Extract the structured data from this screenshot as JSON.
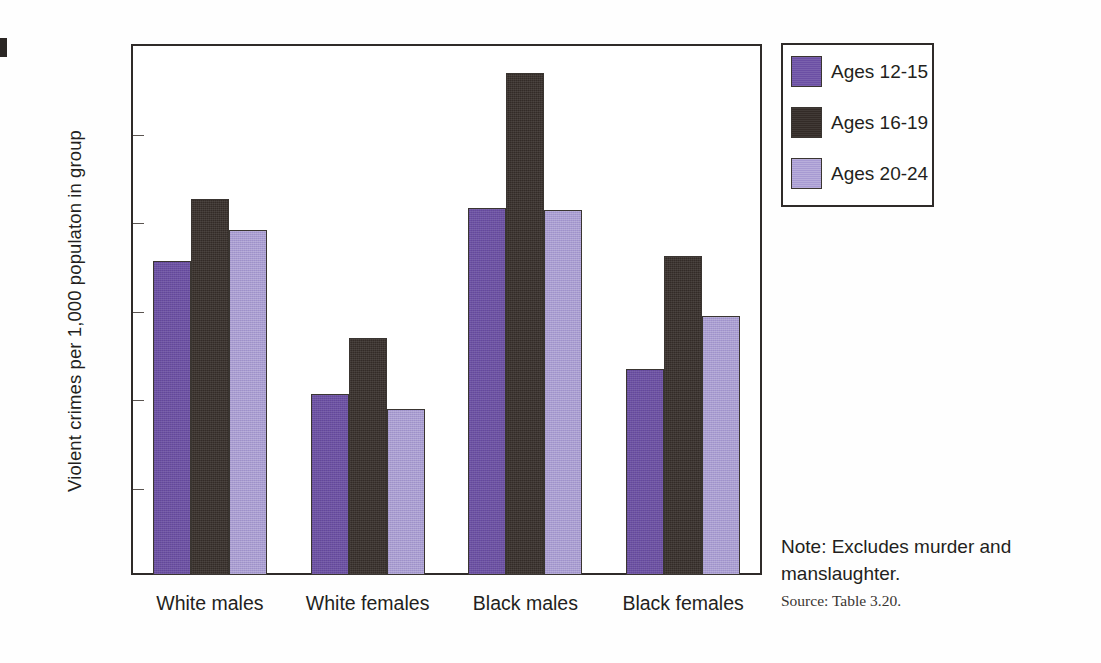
{
  "chart_data": {
    "type": "bar",
    "title": "",
    "xlabel": "",
    "ylabel": "Violent crimes per 1,000 populaton in group",
    "ylim": [
      0,
      120
    ],
    "yticks": [
      0,
      20,
      40,
      60,
      80,
      100,
      120
    ],
    "grid": false,
    "legend_position": "right-top",
    "categories": [
      "White males",
      "White females",
      "Black males",
      "Black females"
    ],
    "series": [
      {
        "name": "Ages 12-15",
        "color": "#6b4fa4",
        "values": [
          71,
          41,
          83,
          46.5
        ]
      },
      {
        "name": "Ages 16-19",
        "color": "#332b27",
        "values": [
          85,
          53.5,
          113.5,
          72
        ]
      },
      {
        "name": "Ages 20-24",
        "color": "#a79ad2",
        "values": [
          78,
          37.5,
          82.5,
          58.5
        ]
      }
    ],
    "annotations": {
      "note": "Note: Excludes murder and manslaughter.",
      "source": "Source: Table 3.20."
    }
  },
  "axis": {
    "y_title": "Violent crimes per 1,000 populaton in group",
    "tick_labels": [
      "120",
      "100",
      "80",
      "60",
      "40",
      "20",
      "0"
    ],
    "category_labels": [
      "White males",
      "White females",
      "Black males",
      "Black females"
    ]
  },
  "legend": {
    "items": [
      {
        "label": "Ages 12-15",
        "color": "#6b4fa4"
      },
      {
        "label": "Ages 16-19",
        "color": "#332b27"
      },
      {
        "label": "Ages 20-24",
        "color": "#a79ad2"
      }
    ]
  },
  "footnote": {
    "note": "Note: Excludes murder and manslaughter.",
    "source": "Source: Table 3.20."
  }
}
